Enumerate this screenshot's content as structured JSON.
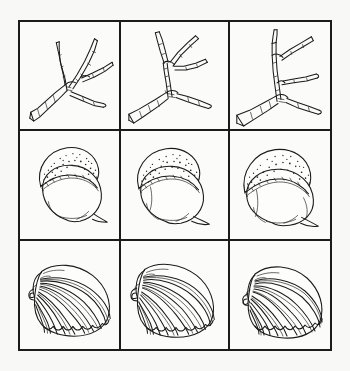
{
  "figure": {
    "title": "Specimen plate: three natural objects in three orientations",
    "background_color": "#f8f8f7",
    "paper_color": "#fbfbfa",
    "ink_color": "#1a1a1a",
    "frame_color": "#1b1b1b",
    "grid": {
      "rows": 3,
      "columns": 3,
      "cell_count": 9
    },
    "style": "pen-and-ink line drawing"
  },
  "rows": [
    {
      "id": "row-twig",
      "subject": "forked twig",
      "label": "Twig",
      "cells": [
        {
          "id": "twig-view-1",
          "label": "Twig view 1",
          "orientation": "branches spread upward and right"
        },
        {
          "id": "twig-view-2",
          "label": "Twig view 2",
          "orientation": "rotated, fork opens to upper right"
        },
        {
          "id": "twig-view-3",
          "label": "Twig view 3",
          "orientation": "rotated, limbs angled steeply upward"
        }
      ]
    },
    {
      "id": "row-acorn",
      "subject": "acorn",
      "label": "Acorn",
      "cells": [
        {
          "id": "acorn-view-1",
          "label": "Acorn view 1",
          "orientation": "cap upper left, tip lower right"
        },
        {
          "id": "acorn-view-2",
          "label": "Acorn view 2",
          "orientation": "cap upper left, nut rotated forward"
        },
        {
          "id": "acorn-view-3",
          "label": "Acorn view 3",
          "orientation": "cap across top, tip lower right"
        }
      ]
    },
    {
      "id": "row-shell",
      "subject": "scallop shell",
      "label": "Scallop shell",
      "cells": [
        {
          "id": "shell-view-1",
          "label": "Shell view 1",
          "orientation": "hinge upper left, fan opening right"
        },
        {
          "id": "shell-view-2",
          "label": "Shell view 2",
          "orientation": "hinge left, fan opening right"
        },
        {
          "id": "shell-view-3",
          "label": "Shell view 3",
          "orientation": "hinge upper left, fan tilted down"
        }
      ]
    }
  ]
}
